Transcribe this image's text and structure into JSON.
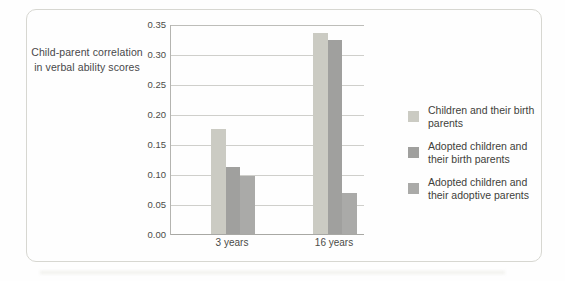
{
  "chart_data": {
    "type": "bar",
    "title_lines": [
      "Child-parent correlation",
      "in verbal ability scores"
    ],
    "categories": [
      "3 years",
      "16 years"
    ],
    "series": [
      {
        "name": "Children and their birth parents",
        "color": "#cbcbc3",
        "values": [
          0.175,
          0.335
        ]
      },
      {
        "name": "Adopted children and their birth parents",
        "color": "#a0a09e",
        "values": [
          0.112,
          0.324
        ]
      },
      {
        "name": "Adopted children and their adoptive parents",
        "color": "#aaaaa8",
        "values": [
          0.097,
          0.068
        ]
      }
    ],
    "ylim": [
      0,
      0.35
    ],
    "yticks": [
      "0.00",
      "0.05",
      "0.10",
      "0.15",
      "0.20",
      "0.25",
      "0.30",
      "0.35"
    ],
    "grid": true,
    "legend_position": "right",
    "xlabel": "",
    "ylabel": ""
  },
  "colors": {
    "card_border": "#d7d7d1",
    "gridline": "#cfcfcb",
    "axis_line": "#a8a8a4",
    "text": "#4b4b47"
  }
}
